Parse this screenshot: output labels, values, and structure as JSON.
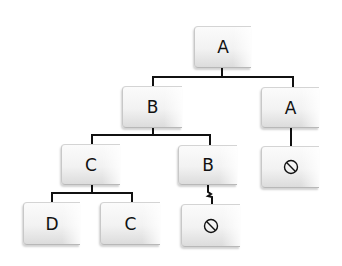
{
  "diagram": {
    "type": "tree",
    "nodes": [
      {
        "id": "n1",
        "label": "A",
        "level": 0,
        "parent": null
      },
      {
        "id": "n2",
        "label": "B",
        "level": 1,
        "parent": "n1"
      },
      {
        "id": "n3",
        "label": "A",
        "level": 1,
        "parent": "n1"
      },
      {
        "id": "n4",
        "label": "C",
        "level": 2,
        "parent": "n2"
      },
      {
        "id": "n5",
        "label": "B",
        "level": 2,
        "parent": "n2"
      },
      {
        "id": "n6",
        "label": "null",
        "level": 2,
        "parent": "n3",
        "icon": "null-icon"
      },
      {
        "id": "n7",
        "label": "D",
        "level": 3,
        "parent": "n4"
      },
      {
        "id": "n8",
        "label": "C",
        "level": 3,
        "parent": "n4"
      },
      {
        "id": "n9",
        "label": "null",
        "level": 3,
        "parent": "n5",
        "icon": "null-icon",
        "edge_style": "zigzag"
      }
    ],
    "colors": {
      "line": "#111111",
      "box_top": "#fbfbfb",
      "box_bottom": "#dcdcdc",
      "text": "#111111"
    }
  }
}
